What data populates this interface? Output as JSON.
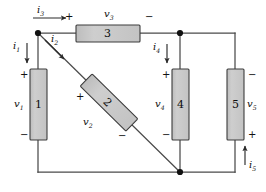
{
  "diagram": {
    "background": "#ffffff",
    "wire_color": "#4a4a4a",
    "element_fill": "#c9c9c9",
    "element_stroke": "#3c3c3c",
    "node_color": "#111111",
    "elements": [
      {
        "id": "element-1",
        "number": "1",
        "orientation": "vertical",
        "voltage_label": "v",
        "voltage_sub": "1",
        "plus_position": "top-left",
        "minus_position": "bottom-left"
      },
      {
        "id": "element-2",
        "number": "2",
        "orientation": "diagonal-45",
        "voltage_label": "v",
        "voltage_sub": "2",
        "plus_position": "upper-left",
        "minus_position": "lower-right"
      },
      {
        "id": "element-3",
        "number": "3",
        "orientation": "horizontal",
        "voltage_label": "v",
        "voltage_sub": "3",
        "plus_position": "left",
        "minus_position": "right"
      },
      {
        "id": "element-4",
        "number": "4",
        "orientation": "vertical",
        "voltage_label": "v",
        "voltage_sub": "4",
        "plus_position": "top-left",
        "minus_position": "bottom-left"
      },
      {
        "id": "element-5",
        "number": "5",
        "orientation": "vertical",
        "voltage_label": "v",
        "voltage_sub": "5",
        "plus_position": "bottom-right",
        "minus_position": "top-right"
      }
    ],
    "currents": [
      {
        "id": "current-i1",
        "label": "i",
        "sub": "1",
        "direction": "down"
      },
      {
        "id": "current-i2",
        "label": "i",
        "sub": "2",
        "direction": "down-right"
      },
      {
        "id": "current-i3",
        "label": "i",
        "sub": "3",
        "direction": "right"
      },
      {
        "id": "current-i4",
        "label": "i",
        "sub": "4",
        "direction": "down"
      },
      {
        "id": "current-i5",
        "label": "i",
        "sub": "5",
        "direction": "up"
      }
    ],
    "nodes": [
      {
        "id": "node-top-left",
        "x": 38,
        "y": 33
      },
      {
        "id": "node-top-right",
        "x": 180,
        "y": 33
      },
      {
        "id": "node-bottom-mid",
        "x": 180,
        "y": 172
      }
    ],
    "signs": {
      "plus": "+",
      "minus": "−"
    }
  }
}
